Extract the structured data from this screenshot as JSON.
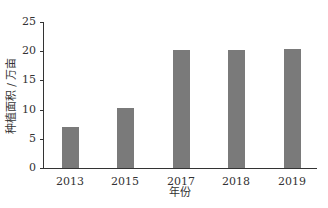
{
  "chart_data": {
    "type": "bar",
    "categories": [
      "2013",
      "2015",
      "2017",
      "2018",
      "2019"
    ],
    "values": [
      7.0,
      10.3,
      20.2,
      20.2,
      20.3
    ],
    "title": "",
    "xlabel": "年份",
    "ylabel": "种植面积 / 万亩",
    "ylim": [
      0,
      25
    ],
    "yticks": [
      "0",
      "5",
      "10",
      "15",
      "20",
      "25"
    ],
    "grid": false,
    "bar_color": "#7a7a7a"
  }
}
